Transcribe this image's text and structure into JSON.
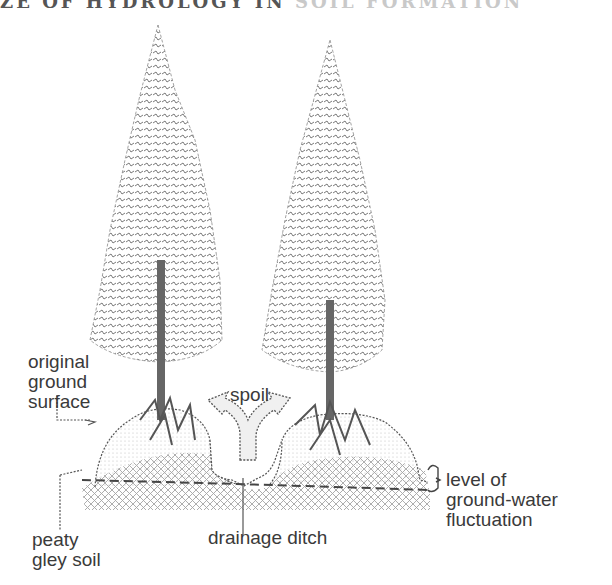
{
  "header": {
    "title_visible": "ZE OF HYDROLOGY IN",
    "title_faded": "SOIL FORMATION"
  },
  "diagram": {
    "labels": {
      "original_ground_surface": "original\nground\nsurface",
      "spoil": "spoil",
      "peaty_gley_soil": "peaty\ngley soil",
      "drainage_ditch": "drainage ditch",
      "ground_water": "level of\nground-water\nfluctuation"
    },
    "elements": [
      "spruce-tree-left",
      "spruce-tree-right",
      "raised-mound-left",
      "raised-mound-right",
      "spoil-arrow",
      "drainage-ditch",
      "water-table-line"
    ],
    "colors": {
      "ink": "#3a3a3a",
      "hatch": "#9a9a9a",
      "foliage": "#6f6f6f"
    }
  }
}
